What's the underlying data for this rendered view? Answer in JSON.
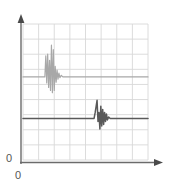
{
  "chart_data": {
    "type": "line",
    "title": "",
    "xlabel": "",
    "ylabel": "",
    "origin_labels": {
      "y_axis": "0",
      "x_axis": "0"
    },
    "axes": {
      "x_arrow": true,
      "y_arrow": true,
      "axis_color": "#6b6b6b",
      "x_axis_y_px": 162,
      "y_axis_x_px": 21,
      "xlim": [
        0,
        8
      ],
      "ylim": [
        0,
        9
      ]
    },
    "grid": {
      "visible": true,
      "color": "#d8d8d8",
      "columns": 8,
      "rows": 9,
      "left_px": 23,
      "right_px": 148,
      "top_px": 24,
      "bottom_px": 160,
      "cell_width_px": 15.6,
      "cell_height_px": 15.1
    },
    "series": [
      {
        "name": "upper-trace",
        "color": "#a8a8a8",
        "baseline_y": 5.5,
        "burst_center_x": 1.9,
        "points": [
          [
            0.0,
            5.5
          ],
          [
            0.5,
            5.5
          ],
          [
            1.0,
            5.5
          ],
          [
            1.25,
            5.5
          ],
          [
            1.4,
            5.5
          ],
          [
            1.46,
            6.9
          ],
          [
            1.52,
            5.1
          ],
          [
            1.58,
            7.0
          ],
          [
            1.64,
            4.8
          ],
          [
            1.7,
            6.6
          ],
          [
            1.76,
            4.6
          ],
          [
            1.82,
            7.6
          ],
          [
            1.88,
            4.45
          ],
          [
            1.94,
            7.3
          ],
          [
            2.0,
            4.6
          ],
          [
            2.06,
            6.2
          ],
          [
            2.12,
            5.15
          ],
          [
            2.18,
            5.95
          ],
          [
            2.24,
            5.35
          ],
          [
            2.3,
            5.75
          ],
          [
            2.36,
            5.45
          ],
          [
            2.45,
            5.6
          ],
          [
            2.55,
            5.5
          ],
          [
            3.0,
            5.5
          ],
          [
            4.0,
            5.5
          ],
          [
            5.0,
            5.5
          ],
          [
            6.0,
            5.5
          ],
          [
            7.0,
            5.5
          ],
          [
            8.0,
            5.5
          ]
        ]
      },
      {
        "name": "lower-trace",
        "color": "#595959",
        "baseline_y": 2.75,
        "burst_center_x": 5.1,
        "points": [
          [
            0.0,
            2.75
          ],
          [
            1.0,
            2.75
          ],
          [
            2.0,
            2.75
          ],
          [
            3.0,
            2.75
          ],
          [
            4.0,
            2.75
          ],
          [
            4.4,
            2.75
          ],
          [
            4.55,
            2.75
          ],
          [
            4.62,
            3.15
          ],
          [
            4.68,
            3.55
          ],
          [
            4.74,
            3.95
          ],
          [
            4.8,
            2.55
          ],
          [
            4.86,
            3.15
          ],
          [
            4.92,
            2.05
          ],
          [
            4.98,
            3.55
          ],
          [
            5.04,
            2.25
          ],
          [
            5.1,
            3.35
          ],
          [
            5.16,
            2.35
          ],
          [
            5.22,
            3.15
          ],
          [
            5.28,
            2.55
          ],
          [
            5.34,
            3.05
          ],
          [
            5.4,
            2.65
          ],
          [
            5.48,
            2.85
          ],
          [
            5.58,
            2.75
          ],
          [
            6.0,
            2.75
          ],
          [
            7.0,
            2.75
          ],
          [
            8.0,
            2.75
          ]
        ]
      }
    ],
    "legend": {
      "visible": false,
      "entries": []
    },
    "annotations": []
  }
}
